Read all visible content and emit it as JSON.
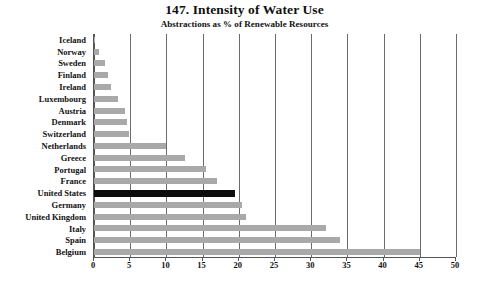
{
  "chart_data": {
    "type": "bar",
    "orientation": "horizontal",
    "title": "147. Intensity of Water Use",
    "subtitle": "Abstractions as % of Renewable Resources",
    "xlabel": "",
    "ylabel": "",
    "xlim": [
      0,
      50
    ],
    "xticks": [
      0,
      5,
      10,
      15,
      20,
      25,
      30,
      35,
      40,
      45,
      50
    ],
    "grid": true,
    "legend": "none",
    "bar_color": "#a9a9a9",
    "highlight_color": "#0d0d0d",
    "highlight_category": "United States",
    "categories": [
      "Iceland",
      "Norway",
      "Sweden",
      "Finland",
      "Ireland",
      "Luxembourg",
      "Austria",
      "Denmark",
      "Switzerland",
      "Netherlands",
      "Greece",
      "Portugal",
      "France",
      "United States",
      "Germany",
      "United Kingdom",
      "Italy",
      "Spain",
      "Belgium"
    ],
    "values": [
      0.1,
      0.7,
      1.5,
      2.0,
      2.3,
      3.3,
      4.3,
      4.5,
      4.8,
      10.0,
      12.5,
      15.5,
      17.0,
      19.5,
      20.5,
      21.0,
      32.0,
      34.0,
      45.0
    ]
  }
}
